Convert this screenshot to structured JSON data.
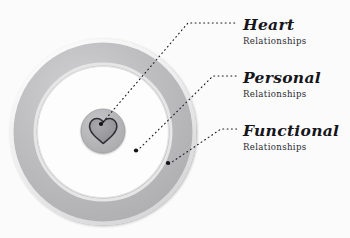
{
  "canvas": {
    "width": 350,
    "height": 238,
    "background": "#fbfbfc"
  },
  "colors": {
    "ring_gray": "#b9b9bb",
    "ring_gray_light": "#cfcfd1",
    "ring_white": "#fdfdfd",
    "inner_circle": "#b4b4b6",
    "heart_outline": "#2f2f35",
    "heart_fill": "#9b9b9e",
    "dot": "#111116",
    "leader_line": "#1a1a20",
    "title_text": "#15151a",
    "sub_text": "#2a2a30"
  },
  "diagram": {
    "name": "concentric-relationship-circles",
    "center": {
      "x": 103,
      "y": 132
    },
    "rings": [
      {
        "id": "functional",
        "name": "outer-ring",
        "outer_radius": 93,
        "inner_radius": 66,
        "fill": "#b9b9bb"
      },
      {
        "id": "personal",
        "name": "middle-ring",
        "outer_radius": 66,
        "inner_radius": 22,
        "fill": "#fdfdfd"
      },
      {
        "id": "heart",
        "name": "inner-circle",
        "outer_radius": 22,
        "inner_radius": 0,
        "fill": "#b4b4b6"
      }
    ],
    "heart_icon": "heart-icon",
    "anchor_dots": [
      {
        "for": "heart",
        "x": 101,
        "y": 124
      },
      {
        "for": "personal",
        "x": 136,
        "y": 150
      },
      {
        "for": "functional",
        "x": 168,
        "y": 163
      }
    ]
  },
  "leaders": [
    {
      "for": "heart",
      "from": {
        "x": 103,
        "y": 122
      },
      "bend": {
        "x": 188,
        "y": 23
      },
      "to": {
        "x": 238,
        "y": 23
      }
    },
    {
      "for": "personal",
      "from": {
        "x": 137,
        "y": 151
      },
      "bend": {
        "x": 213,
        "y": 76
      },
      "to": {
        "x": 238,
        "y": 76
      }
    },
    {
      "for": "functional",
      "from": {
        "x": 169,
        "y": 164
      },
      "bend": {
        "x": 221,
        "y": 129
      },
      "to": {
        "x": 238,
        "y": 129
      }
    }
  ],
  "labels": [
    {
      "id": "heart",
      "title": "Heart",
      "subtitle": "Relationships"
    },
    {
      "id": "personal",
      "title": "Personal",
      "subtitle": "Relationships"
    },
    {
      "id": "functional",
      "title": "Functional",
      "subtitle": "Relationships"
    }
  ]
}
